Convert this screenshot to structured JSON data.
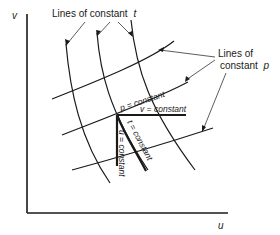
{
  "diagram": {
    "axes": {
      "y_label": "v",
      "x_label": "u"
    },
    "labels": {
      "constant_t_line1": "Lines of constant",
      "constant_t_var": "t",
      "constant_p_line1": "Lines of",
      "constant_p_line2": "constant",
      "constant_p_var": "p",
      "p_constant": "p = constant",
      "v_constant": "v = constant",
      "t_constant": "t = constant",
      "u_constant": "u = constant"
    },
    "colors": {
      "ink": "#1a1a1a",
      "background": "#ffffff"
    }
  }
}
